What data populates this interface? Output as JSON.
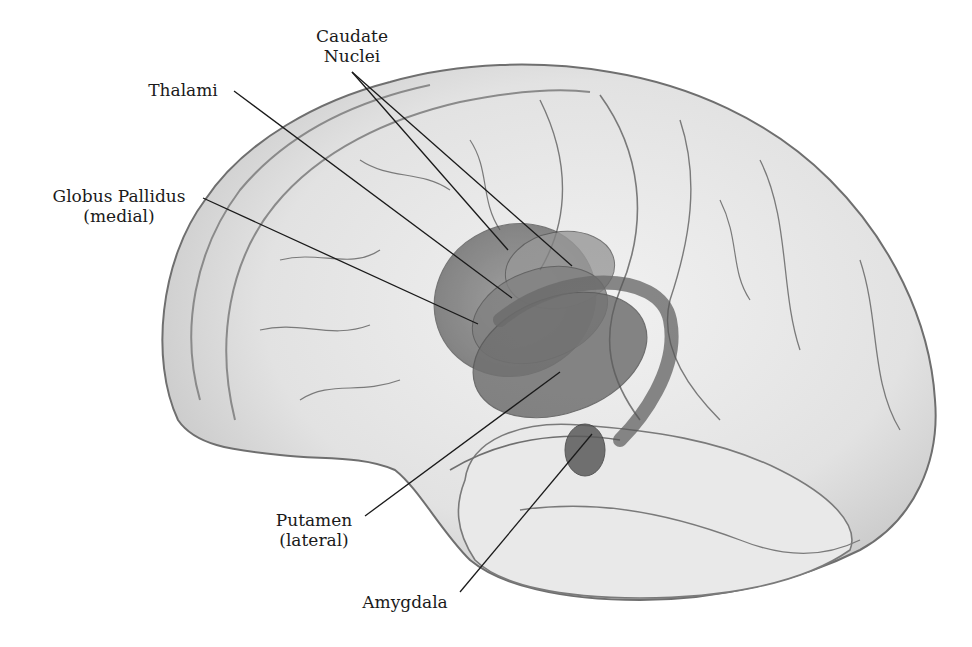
{
  "figure": {
    "colors": {
      "background": "#ffffff",
      "brain_fill": "#e6e6e6",
      "brain_outline": "#6f6f6f",
      "sulci": "#7a7a7a",
      "structures": "#5e5e5e",
      "leader_lines": "#1a1a1a",
      "label_text": "#1a1a1a"
    }
  },
  "labels": {
    "caudate": {
      "line1": "Caudate",
      "line2": "Nuclei"
    },
    "thalami": {
      "line1": "Thalami"
    },
    "globus_pallidus": {
      "line1": "Globus Pallidus",
      "line2": "(medial)"
    },
    "putamen": {
      "line1": "Putamen",
      "line2": "(lateral)"
    },
    "amygdala": {
      "line1": "Amygdala"
    }
  }
}
